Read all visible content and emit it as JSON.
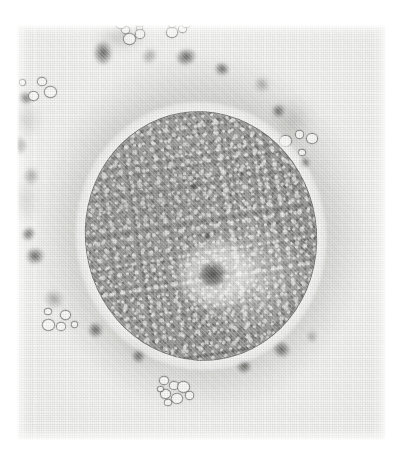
{
  "image": {
    "kind": "light-micrograph",
    "modality": "phase-contrast brightfield micrograph, halftone print reproduction",
    "subject": "single large spherical cell (oocyte) surrounded by a layer of granular cumulus / corona cells and cellular debris",
    "color_mode": "grayscale",
    "page_background": "#ffffff",
    "plate_background": "#f2f2f0",
    "plate": {
      "left": 17,
      "top": 25,
      "width": 369,
      "height": 415
    },
    "caption": ""
  },
  "structures": {
    "oocyte": {
      "label": "oocyte",
      "center_x": 184,
      "center_y": 211,
      "width": 232,
      "height": 250,
      "rotation_deg": -9,
      "membrane_color": "#5a5a58",
      "cytoplasm_color": "#9a9a98",
      "texture": "fine uniform granular stippling"
    },
    "perivitelline_halo": {
      "label": "bright perivitelline halo",
      "color": "#ffffff"
    },
    "nucleolus": {
      "label": "nucleolus",
      "rel_x": 52,
      "rel_y": 66,
      "width": 27,
      "height": 24,
      "color": "#484846"
    },
    "perinucleolar_zone": {
      "label": "pale perinucleolar zone",
      "rel_x": 54,
      "rel_y": 66,
      "width": 84,
      "height": 70,
      "color": "#f0f0ee"
    },
    "cytoplasmic_vesicles": [
      {
        "name": "vesicle-upper-left",
        "x": 112,
        "y": 70,
        "w": 8,
        "h": 8
      },
      {
        "name": "vesicle-upper-right",
        "x": 162,
        "y": 66,
        "w": 6,
        "h": 6
      },
      {
        "name": "vesicle-mid",
        "x": 118,
        "y": 122,
        "w": 7,
        "h": 7
      }
    ]
  },
  "corona_debris": {
    "label": "corona radiata cells and cellular debris",
    "dark_granules": [
      {
        "name": "granule-top-1",
        "x": 103,
        "y": 53,
        "w": 26,
        "h": 20
      },
      {
        "name": "granule-top-2",
        "x": 149,
        "y": 56,
        "w": 19,
        "h": 16
      },
      {
        "name": "granule-top-3",
        "x": 186,
        "y": 57,
        "w": 22,
        "h": 18
      },
      {
        "name": "granule-top-4",
        "x": 222,
        "y": 69,
        "w": 16,
        "h": 14
      },
      {
        "name": "granule-right-1",
        "x": 262,
        "y": 84,
        "w": 18,
        "h": 17
      },
      {
        "name": "granule-right-2",
        "x": 278,
        "y": 111,
        "w": 15,
        "h": 14
      },
      {
        "name": "granule-right-3",
        "x": 304,
        "y": 163,
        "w": 13,
        "h": 12
      },
      {
        "name": "granule-right-4",
        "x": 296,
        "y": 196,
        "w": 11,
        "h": 11
      },
      {
        "name": "granule-left-1",
        "x": 25,
        "y": 98,
        "w": 16,
        "h": 14
      },
      {
        "name": "granule-left-2",
        "x": 17,
        "y": 145,
        "w": 22,
        "h": 20
      },
      {
        "name": "granule-left-3",
        "x": 31,
        "y": 176,
        "w": 20,
        "h": 18
      },
      {
        "name": "granule-left-4",
        "x": 28,
        "y": 234,
        "w": 16,
        "h": 14
      },
      {
        "name": "granule-left-5",
        "x": 35,
        "y": 256,
        "w": 20,
        "h": 18
      },
      {
        "name": "granule-bot-left",
        "x": 54,
        "y": 299,
        "w": 22,
        "h": 20
      },
      {
        "name": "granule-bot-1",
        "x": 95,
        "y": 330,
        "w": 17,
        "h": 16
      },
      {
        "name": "granule-bot-2",
        "x": 138,
        "y": 356,
        "w": 15,
        "h": 14
      },
      {
        "name": "granule-bot-3",
        "x": 196,
        "y": 352,
        "w": 30,
        "h": 26
      },
      {
        "name": "granule-bot-4",
        "x": 244,
        "y": 366,
        "w": 16,
        "h": 15
      },
      {
        "name": "granule-bot-5",
        "x": 281,
        "y": 349,
        "w": 19,
        "h": 17
      },
      {
        "name": "granule-bot-6",
        "x": 312,
        "y": 336,
        "w": 14,
        "h": 13
      }
    ],
    "soft_blobs": [
      {
        "name": "soft-left-1",
        "x": 22,
        "y": 120,
        "w": 42,
        "h": 38
      },
      {
        "name": "soft-left-2",
        "x": 18,
        "y": 200,
        "w": 46,
        "h": 50
      },
      {
        "name": "soft-right-1",
        "x": 292,
        "y": 120,
        "w": 44,
        "h": 46
      },
      {
        "name": "soft-right-2",
        "x": 300,
        "y": 212,
        "w": 40,
        "h": 44
      },
      {
        "name": "soft-top-1",
        "x": 120,
        "y": 36,
        "w": 52,
        "h": 34
      },
      {
        "name": "soft-bot-1",
        "x": 150,
        "y": 344,
        "w": 58,
        "h": 36
      }
    ],
    "bright_vesicle_clusters": [
      {
        "name": "cluster-top-left",
        "x": 133,
        "y": 28,
        "members": 7
      },
      {
        "name": "cluster-top-right",
        "x": 178,
        "y": 24,
        "members": 6
      },
      {
        "name": "cluster-left",
        "x": 38,
        "y": 88,
        "members": 4
      },
      {
        "name": "cluster-right",
        "x": 300,
        "y": 140,
        "members": 4
      },
      {
        "name": "cluster-bot-left",
        "x": 60,
        "y": 322,
        "members": 5
      },
      {
        "name": "cluster-bot",
        "x": 172,
        "y": 392,
        "members": 8
      }
    ]
  },
  "print": {
    "halftone_screen": "orthogonal dot raster, ~2.2 px pitch",
    "paper_tone": "#f4f4f2"
  }
}
